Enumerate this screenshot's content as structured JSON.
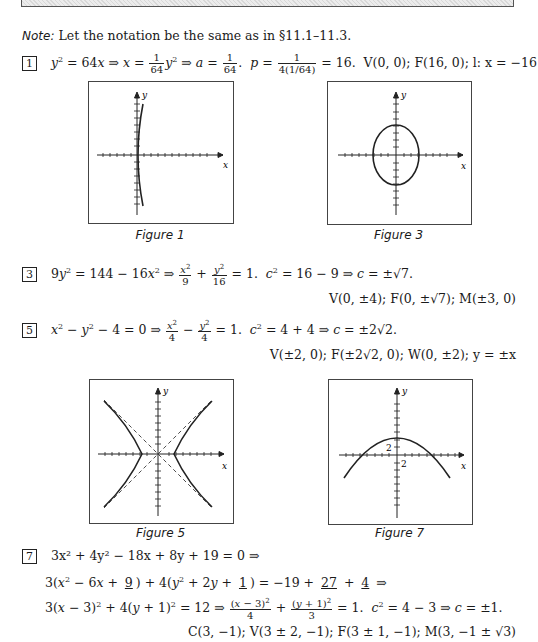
{
  "header_bar": {
    "pattern": "hatched"
  },
  "note": {
    "label": "Note:",
    "text": "Let the notation be the same as in §11.1–11.3."
  },
  "problems": [
    {
      "number": "1",
      "lines": [
        "y² = 64x ⇒ x = (1/64)y² ⇒ a = 1/64.  p = 1/(4(1/64)) = 16.  V(0, 0); F(16, 0); l: x = −16"
      ]
    },
    {
      "number": "3",
      "lines": [
        "9y² = 144 − 16x² ⇒ x²/9 + y²/16 = 1.  c² = 16 − 9 ⇒ c = ±√7.",
        "V(0, ±4); F(0, ±√7); M(±3, 0)"
      ]
    },
    {
      "number": "5",
      "lines": [
        "x² − y² − 4 = 0 ⇒ x²/4 − y²/4 = 1.  c² = 4 + 4 ⇒ c = ±2√2.",
        "V(±2, 0); F(±2√2, 0); W(0, ±2); y = ±x"
      ]
    },
    {
      "number": "7",
      "lines": [
        "3x² + 4y² − 18x + 8y + 19 = 0 ⇒",
        "3(x² − 6x + 9) + 4(y² + 2y + 1) = −19 + 27 + 4 ⇒",
        "3(x − 3)² + 4(y + 1)² = 12 ⇒ (x − 3)²/4 + (y + 1)²/3 = 1.  c² = 4 − 3 ⇒ c = ±1.",
        "C(3, −1); V(3 ± 2, −1); F(3 ± 1, −1); M(3, −1 ± √3)"
      ]
    }
  ],
  "figures": [
    {
      "caption": "Figure 1",
      "x_label": "x",
      "y_label": "y",
      "curve": "parabola opening right"
    },
    {
      "caption": "Figure 3",
      "x_label": "x",
      "y_label": "y",
      "curve": "vertical ellipse"
    },
    {
      "caption": "Figure 5",
      "x_label": "x",
      "y_label": "y",
      "curve": "hyperbola with dashed asymptotes"
    },
    {
      "caption": "Figure 7",
      "x_label": "x",
      "y_label": "y",
      "curve": "parabola opening down",
      "tick_labels": [
        "2",
        "2"
      ]
    }
  ],
  "text": {
    "p1_tail": "V(0, 0); F(16, 0); l: x = −16",
    "p3_line2": "V(0, ±4); F(0, ±√7); M(±3, 0)",
    "p5_line2": "V(±2, 0); F(±2√2, 0); W(0, ±2); y = ±x",
    "p7_line1": "3x² + 4y² − 18x + 8y + 19 = 0 ⇒",
    "p7_line4": "C(3, −1); V(3 ± 2, −1); F(3 ± 1, −1); M(3, −1 ± √3)"
  }
}
